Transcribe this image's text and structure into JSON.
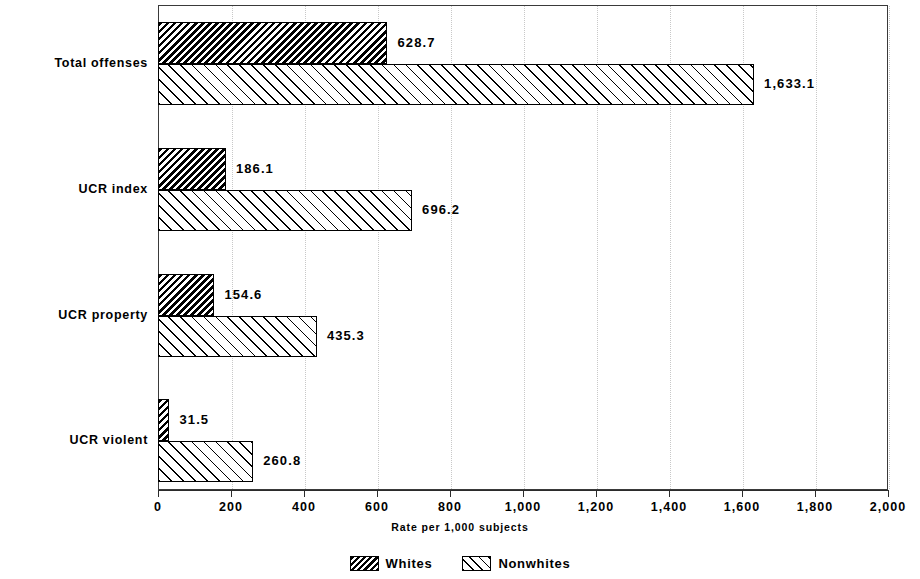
{
  "chart_data": {
    "type": "bar",
    "orientation": "horizontal",
    "title": "",
    "xlabel": "Rate per 1,000 subjects",
    "ylabel": "",
    "xlim": [
      0,
      2000
    ],
    "xticks": [
      0,
      200,
      400,
      600,
      800,
      1000,
      1200,
      1400,
      1600,
      1800,
      2000
    ],
    "xtick_labels": [
      "0",
      "200",
      "400",
      "600",
      "800",
      "1,000",
      "1,200",
      "1,400",
      "1,600",
      "1,800",
      "2,000"
    ],
    "categories": [
      "Total offenses",
      "UCR index",
      "UCR property",
      "UCR violent"
    ],
    "grid": true,
    "grid_axis": "x",
    "grid_style": "dotted",
    "legend_position": "bottom",
    "series": [
      {
        "name": "Whites",
        "pattern": "dense-backslash-hatch",
        "values": [
          628.7,
          186.1,
          154.6,
          31.5
        ],
        "value_labels": [
          "628.7",
          "186.1",
          "154.6",
          "31.5"
        ]
      },
      {
        "name": "Nonwhites",
        "pattern": "sparse-forwardslash-hatch",
        "values": [
          1633.1,
          696.2,
          435.3,
          260.8
        ],
        "value_labels": [
          "1,633.1",
          "696.2",
          "435.3",
          "260.8"
        ]
      }
    ]
  },
  "legend": {
    "items": [
      {
        "label": "Whites"
      },
      {
        "label": "Nonwhites"
      }
    ]
  },
  "axis": {
    "title": "Rate per 1,000 subjects"
  },
  "colors": {
    "ink": "#000000",
    "frame": "#3a3a3a",
    "gridline": "#c8c8c8",
    "background": "#ffffff"
  }
}
